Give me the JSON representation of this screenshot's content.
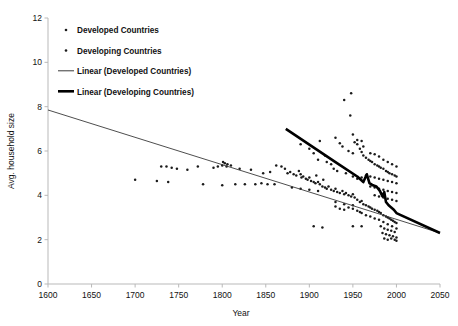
{
  "chart_data": {
    "type": "scatter",
    "title": "",
    "xlabel": "Year",
    "ylabel": "Avg. household size",
    "xlim": [
      1600,
      2050
    ],
    "ylim": [
      0,
      12
    ],
    "xticks": [
      1600,
      1650,
      1700,
      1750,
      1800,
      1850,
      1900,
      1950,
      2000,
      2050
    ],
    "yticks": [
      0,
      2,
      4,
      6,
      8,
      10,
      12
    ],
    "grid": false,
    "legend_position": "top-left",
    "legend": [
      {
        "label": "Developed Countries",
        "marker": "dot",
        "color": "#1b1b1b"
      },
      {
        "label": "Developing Countries",
        "marker": "dot",
        "color": "#1b1b1b"
      },
      {
        "label": "Linear (Developed Countries)",
        "marker": "thin-line",
        "color": "#3a3a3a"
      },
      {
        "label": "Linear (Developing Countries)",
        "marker": "thick-line",
        "color": "#000000"
      }
    ],
    "series": [
      {
        "name": "Developed Countries",
        "marker": "dot",
        "color": "#1b1b1b",
        "points": [
          [
            1700,
            4.7
          ],
          [
            1730,
            5.3
          ],
          [
            1736,
            5.3
          ],
          [
            1742,
            5.25
          ],
          [
            1748,
            5.2
          ],
          [
            1725,
            4.65
          ],
          [
            1738,
            4.6
          ],
          [
            1760,
            5.15
          ],
          [
            1772,
            5.3
          ],
          [
            1790,
            5.25
          ],
          [
            1795,
            5.3
          ],
          [
            1800,
            5.35
          ],
          [
            1805,
            5.3
          ],
          [
            1810,
            5.35
          ],
          [
            1801,
            5.5
          ],
          [
            1803,
            5.45
          ],
          [
            1806,
            5.4
          ],
          [
            1778,
            4.5
          ],
          [
            1800,
            4.45
          ],
          [
            1815,
            4.5
          ],
          [
            1826,
            4.5
          ],
          [
            1838,
            4.5
          ],
          [
            1845,
            4.55
          ],
          [
            1852,
            4.5
          ],
          [
            1860,
            4.5
          ],
          [
            1820,
            5.2
          ],
          [
            1833,
            5.15
          ],
          [
            1847,
            5.0
          ],
          [
            1855,
            5.05
          ],
          [
            1862,
            5.35
          ],
          [
            1868,
            5.3
          ],
          [
            1872,
            5.2
          ],
          [
            1875,
            5.0
          ],
          [
            1878,
            5.05
          ],
          [
            1882,
            4.95
          ],
          [
            1885,
            4.9
          ],
          [
            1888,
            5.1
          ],
          [
            1890,
            4.95
          ],
          [
            1891,
            4.8
          ],
          [
            1893,
            4.85
          ],
          [
            1896,
            4.75
          ],
          [
            1898,
            4.7
          ],
          [
            1900,
            4.8
          ],
          [
            1902,
            4.65
          ],
          [
            1905,
            4.6
          ],
          [
            1907,
            4.55
          ],
          [
            1910,
            4.6
          ],
          [
            1912,
            4.5
          ],
          [
            1880,
            4.35
          ],
          [
            1890,
            4.3
          ],
          [
            1900,
            4.25
          ],
          [
            1910,
            4.2
          ],
          [
            1915,
            4.4
          ],
          [
            1918,
            4.35
          ],
          [
            1920,
            4.3
          ],
          [
            1922,
            4.4
          ],
          [
            1925,
            4.25
          ],
          [
            1928,
            4.2
          ],
          [
            1930,
            4.3
          ],
          [
            1932,
            4.15
          ],
          [
            1935,
            4.1
          ],
          [
            1938,
            4.2
          ],
          [
            1940,
            4.05
          ],
          [
            1942,
            4.1
          ],
          [
            1945,
            4.0
          ],
          [
            1948,
            3.95
          ],
          [
            1950,
            4.05
          ],
          [
            1952,
            3.9
          ],
          [
            1930,
            3.7
          ],
          [
            1940,
            3.6
          ],
          [
            1950,
            3.55
          ],
          [
            1955,
            3.8
          ],
          [
            1958,
            3.7
          ],
          [
            1960,
            3.75
          ],
          [
            1962,
            3.6
          ],
          [
            1965,
            3.55
          ],
          [
            1968,
            3.5
          ],
          [
            1970,
            3.45
          ],
          [
            1972,
            3.4
          ],
          [
            1975,
            3.35
          ],
          [
            1978,
            3.3
          ],
          [
            1980,
            3.25
          ],
          [
            1982,
            3.2
          ],
          [
            1985,
            3.1
          ],
          [
            1988,
            3.05
          ],
          [
            1990,
            3.0
          ],
          [
            1992,
            2.95
          ],
          [
            1994,
            2.9
          ],
          [
            1996,
            2.85
          ],
          [
            1998,
            2.8
          ],
          [
            2000,
            2.75
          ],
          [
            1980,
            2.9
          ],
          [
            1985,
            2.8
          ],
          [
            1990,
            2.7
          ],
          [
            1995,
            2.6
          ],
          [
            2000,
            2.5
          ],
          [
            1982,
            2.6
          ],
          [
            1986,
            2.5
          ],
          [
            1990,
            2.45
          ],
          [
            1994,
            2.4
          ],
          [
            1998,
            2.35
          ],
          [
            1984,
            2.3
          ],
          [
            1988,
            2.25
          ],
          [
            1992,
            2.2
          ],
          [
            1996,
            2.15
          ],
          [
            2000,
            2.1
          ],
          [
            1986,
            2.05
          ],
          [
            1990,
            2.0
          ],
          [
            1994,
            2.05
          ],
          [
            1998,
            2.0
          ],
          [
            2000,
            1.95
          ],
          [
            1960,
            3.2
          ],
          [
            1965,
            3.1
          ],
          [
            1970,
            3.05
          ],
          [
            1975,
            2.95
          ],
          [
            1955,
            3.3
          ],
          [
            1958,
            3.25
          ],
          [
            1950,
            3.4
          ],
          [
            1945,
            3.45
          ],
          [
            1940,
            3.35
          ],
          [
            1935,
            3.4
          ],
          [
            1930,
            3.5
          ],
          [
            1905,
            2.6
          ],
          [
            1915,
            2.55
          ],
          [
            1950,
            2.6
          ],
          [
            1960,
            2.6
          ]
        ]
      },
      {
        "name": "Developing Countries",
        "marker": "dot",
        "color": "#1b1b1b",
        "points": [
          [
            1890,
            6.3
          ],
          [
            1900,
            6.1
          ],
          [
            1905,
            5.9
          ],
          [
            1910,
            5.6
          ],
          [
            1912,
            6.45
          ],
          [
            1918,
            5.8
          ],
          [
            1920,
            5.5
          ],
          [
            1930,
            6.6
          ],
          [
            1935,
            6.35
          ],
          [
            1938,
            6.2
          ],
          [
            1940,
            8.3
          ],
          [
            1948,
            8.6
          ],
          [
            1947,
            7.6
          ],
          [
            1945,
            6.0
          ],
          [
            1950,
            5.9
          ],
          [
            1952,
            6.4
          ],
          [
            1955,
            6.3
          ],
          [
            1958,
            6.1
          ],
          [
            1960,
            5.95
          ],
          [
            1962,
            5.8
          ],
          [
            1965,
            5.7
          ],
          [
            1950,
            6.75
          ],
          [
            1955,
            6.5
          ],
          [
            1960,
            6.45
          ],
          [
            1962,
            6.2
          ],
          [
            1968,
            5.6
          ],
          [
            1970,
            5.55
          ],
          [
            1972,
            5.5
          ],
          [
            1975,
            5.4
          ],
          [
            1978,
            5.35
          ],
          [
            1980,
            5.3
          ],
          [
            1982,
            5.25
          ],
          [
            1985,
            5.2
          ],
          [
            1988,
            5.1
          ],
          [
            1990,
            5.05
          ],
          [
            1992,
            5.0
          ],
          [
            1995,
            4.95
          ],
          [
            1998,
            4.9
          ],
          [
            2000,
            4.85
          ],
          [
            1970,
            5.9
          ],
          [
            1975,
            5.85
          ],
          [
            1980,
            5.75
          ],
          [
            1985,
            5.6
          ],
          [
            1990,
            5.5
          ],
          [
            1995,
            5.4
          ],
          [
            2000,
            5.3
          ],
          [
            1965,
            4.9
          ],
          [
            1970,
            4.85
          ],
          [
            1975,
            4.8
          ],
          [
            1980,
            4.75
          ],
          [
            1985,
            4.7
          ],
          [
            1990,
            4.65
          ],
          [
            1995,
            4.6
          ],
          [
            2000,
            4.55
          ],
          [
            1960,
            4.8
          ],
          [
            1955,
            4.75
          ],
          [
            1950,
            4.85
          ],
          [
            1970,
            4.4
          ],
          [
            1975,
            4.35
          ],
          [
            1980,
            4.3
          ],
          [
            1985,
            4.25
          ],
          [
            1990,
            4.2
          ],
          [
            1995,
            4.15
          ],
          [
            2000,
            4.1
          ],
          [
            1975,
            4.0
          ],
          [
            1980,
            3.95
          ],
          [
            1985,
            3.9
          ],
          [
            1990,
            3.85
          ],
          [
            1995,
            3.8
          ],
          [
            2000,
            3.75
          ],
          [
            1925,
            5.4
          ],
          [
            1928,
            5.2
          ],
          [
            1932,
            5.1
          ],
          [
            1942,
            5.0
          ],
          [
            1908,
            4.9
          ],
          [
            1916,
            4.7
          ]
        ]
      }
    ],
    "trendlines": [
      {
        "name": "Linear (Developed Countries)",
        "style": "thin",
        "color": "#3a3a3a",
        "from": [
          1600,
          7.85
        ],
        "to": [
          2050,
          2.3
        ]
      },
      {
        "name": "Linear (Developing Countries)",
        "style": "thick",
        "color": "#000000",
        "from": [
          1873,
          7.0
        ],
        "to": [
          2050,
          2.3
        ],
        "path": [
          [
            1873,
            7.0
          ],
          [
            1930,
            5.5
          ],
          [
            1955,
            4.85
          ],
          [
            1962,
            4.6
          ],
          [
            1966,
            4.95
          ],
          [
            1969,
            4.55
          ],
          [
            1973,
            4.45
          ],
          [
            1977,
            4.4
          ],
          [
            1981,
            4.2
          ],
          [
            1984,
            3.95
          ],
          [
            1986,
            4.15
          ],
          [
            1988,
            3.7
          ],
          [
            1991,
            3.55
          ],
          [
            1994,
            3.45
          ],
          [
            1997,
            3.35
          ],
          [
            2000,
            3.2
          ],
          [
            2050,
            2.3
          ]
        ]
      }
    ]
  }
}
